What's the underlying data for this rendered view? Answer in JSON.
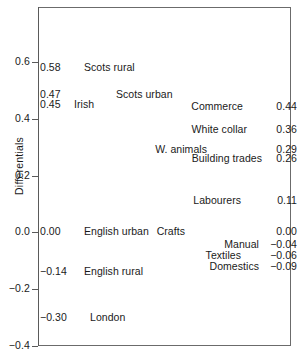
{
  "chart_data": {
    "type": "scatter",
    "title": "",
    "subtitle": "",
    "xlabel": "",
    "ylabel": "Differentials",
    "ylim": [
      -0.4,
      0.6
    ],
    "xlim": [
      0,
      1
    ],
    "grid": false,
    "legend": null,
    "yticks": [
      "0.6",
      "0.4",
      "0.2",
      "0.0",
      "−0.2",
      "−0.4"
    ],
    "ytick_values": [
      0.6,
      0.4,
      0.2,
      0.0,
      -0.2,
      -0.4
    ],
    "xticks": [],
    "annotation_style": "text-only labels positioned at their value on the y axis",
    "series": [
      {
        "name": "Region / origin",
        "column": "left",
        "points": [
          {
            "label": "Scots rural",
            "value": 0.58,
            "value_text": "0.58",
            "y": 0.58,
            "name_offset": 14
          },
          {
            "label": "Scots urban",
            "value": 0.47,
            "value_text": "0.47",
            "y": 0.485,
            "name_offset": 46
          },
          {
            "label": "Irish",
            "value": 0.45,
            "value_text": "0.45",
            "y": 0.45,
            "name_offset": 4
          },
          {
            "label": "English urban",
            "value": 0.0,
            "value_text": "0.00",
            "y": 0.0,
            "name_offset": 14
          },
          {
            "label": "English rural",
            "value": -0.14,
            "value_text": "−0.14",
            "y": -0.14,
            "name_offset": 14
          },
          {
            "label": "London",
            "value": -0.3,
            "value_text": "−0.30",
            "y": -0.3,
            "name_offset": 20
          }
        ]
      },
      {
        "name": "Occupation",
        "column": "right",
        "points": [
          {
            "label": "Commerce",
            "value": 0.44,
            "value_text": "0.44",
            "y": 0.44,
            "name_gap": 20
          },
          {
            "label": "White collar",
            "value": 0.36,
            "value_text": "0.36",
            "y": 0.36,
            "name_gap": 16
          },
          {
            "label": "W. animals",
            "value": 0.29,
            "value_text": "0.29",
            "y": 0.29,
            "name_gap": 56
          },
          {
            "label": "Building trades",
            "value": 0.26,
            "value_text": "0.26",
            "y": 0.26,
            "name_gap": 1
          },
          {
            "label": "Labourers",
            "value": 0.11,
            "value_text": "0.11",
            "y": 0.11,
            "name_gap": 22
          },
          {
            "label": "Crafts",
            "value": 0.0,
            "value_text": "0.00",
            "y": 0.0,
            "name_gap": 78
          },
          {
            "label": "Manual",
            "value": -0.04,
            "value_text": "−0.04",
            "y": -0.043,
            "name_gap": 4
          },
          {
            "label": "Textiles",
            "value": -0.06,
            "value_text": "−0.06",
            "y": -0.082,
            "name_gap": 22
          },
          {
            "label": "Domestics",
            "value": -0.09,
            "value_text": "−0.09",
            "y": -0.122,
            "name_gap": 4
          }
        ]
      }
    ]
  },
  "colors": {
    "background": "#ffffff",
    "text": "#1a1a1a",
    "axis": "#5a5a5a",
    "frame": "#6b6b6b"
  }
}
